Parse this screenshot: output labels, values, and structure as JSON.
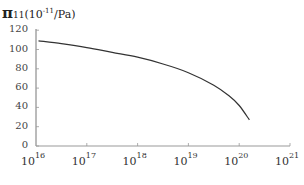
{
  "chart_data": {
    "type": "line",
    "ylabel": "π11 (10^-11/Pa)",
    "xlabel": "",
    "xscale": "log",
    "xlim_exponents": [
      16,
      21
    ],
    "ylim": [
      0,
      120
    ],
    "grid": false,
    "legend": null,
    "y_ticks": [
      "120",
      "100",
      "80",
      "60",
      "40",
      "20",
      "0"
    ],
    "x_ticks": [
      {
        "base": "10",
        "exp": "16"
      },
      {
        "base": "10",
        "exp": "17"
      },
      {
        "base": "10",
        "exp": "18"
      },
      {
        "base": "10",
        "exp": "19"
      },
      {
        "base": "10",
        "exp": "20"
      },
      {
        "base": "10",
        "exp": "21"
      }
    ],
    "series": [
      {
        "name": "π11",
        "x_log10": [
          16.05,
          16.5,
          17.0,
          17.5,
          18.0,
          18.5,
          19.0,
          19.5,
          19.8,
          20.0,
          20.2
        ],
        "values": [
          109,
          106,
          102,
          97,
          92,
          85,
          76,
          63,
          52,
          42,
          27
        ]
      }
    ]
  },
  "title": {
    "symbol": "π",
    "subscript": "11",
    "unit_prefix": "(10",
    "unit_exp": "-11",
    "unit_suffix": "/Pa)"
  }
}
